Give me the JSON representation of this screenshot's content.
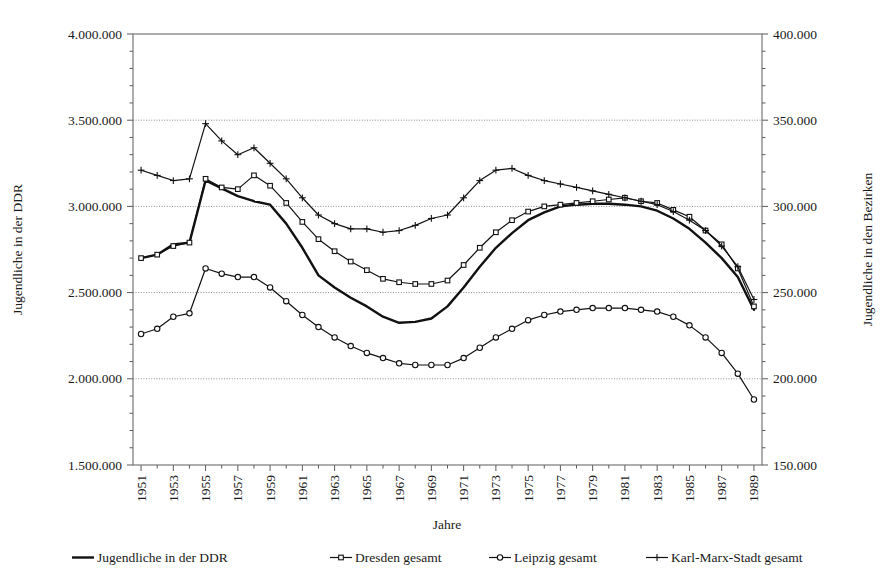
{
  "chart_data": {
    "type": "line",
    "title": "",
    "xlabel": "Jahre",
    "ylabel": "Jugendliche in der DDR",
    "ylabel_right": "Jugendliche in den Bezirken",
    "grid": true,
    "legend_position": "bottom",
    "x": [
      1951,
      1952,
      1953,
      1954,
      1955,
      1956,
      1957,
      1958,
      1959,
      1960,
      1961,
      1962,
      1963,
      1964,
      1965,
      1966,
      1967,
      1968,
      1969,
      1970,
      1971,
      1972,
      1973,
      1974,
      1975,
      1976,
      1977,
      1978,
      1979,
      1980,
      1981,
      1982,
      1983,
      1984,
      1985,
      1986,
      1987,
      1988,
      1989
    ],
    "xtick_labels": [
      "1951",
      "1953",
      "1955",
      "1957",
      "1959",
      "1961",
      "1963",
      "1965",
      "1967",
      "1969",
      "1971",
      "1973",
      "1975",
      "1977",
      "1979",
      "1981",
      "1983",
      "1985",
      "1987",
      "1989"
    ],
    "xlim": [
      1950.5,
      1989.5
    ],
    "ylim_left": [
      1500000,
      4000000
    ],
    "ytick_labels_left": [
      "1.500.000",
      "2.000.000",
      "2.500.000",
      "3.000.000",
      "3.500.000",
      "4.000.000"
    ],
    "ytick_values_left": [
      1500000,
      2000000,
      2500000,
      3000000,
      3500000,
      4000000
    ],
    "ylim_right": [
      150000,
      400000
    ],
    "ytick_labels_right": [
      "150.000",
      "200.000",
      "250.000",
      "300.000",
      "350.000",
      "400.000"
    ],
    "ytick_values_right": [
      150000,
      200000,
      250000,
      300000,
      350000,
      400000
    ],
    "series": [
      {
        "name": "Jugendliche in der DDR",
        "axis": "left",
        "marker": "none",
        "line_width": 2.4,
        "color": "#111111",
        "values": [
          2700000,
          2720000,
          2780000,
          2790000,
          3150000,
          3105000,
          3060000,
          3030000,
          3010000,
          2900000,
          2760000,
          2600000,
          2530000,
          2470000,
          2420000,
          2360000,
          2325000,
          2330000,
          2350000,
          2420000,
          2530000,
          2650000,
          2760000,
          2845000,
          2920000,
          2965000,
          3000000,
          3010000,
          3015000,
          3015000,
          3010000,
          3000000,
          2975000,
          2930000,
          2870000,
          2790000,
          2700000,
          2590000,
          2400000
        ]
      },
      {
        "name": "Dresden gesamt",
        "axis": "right",
        "marker": "square",
        "line_width": 1.2,
        "color": "#111111",
        "values": [
          270000,
          272000,
          277000,
          279000,
          316000,
          311000,
          310000,
          318000,
          312000,
          302000,
          291000,
          281000,
          274000,
          268000,
          263000,
          258000,
          256000,
          255000,
          255000,
          257000,
          266000,
          276000,
          285000,
          292000,
          297000,
          300000,
          301000,
          302000,
          303000,
          304000,
          305000,
          303000,
          302000,
          298000,
          294000,
          286000,
          278000,
          264000,
          242000
        ]
      },
      {
        "name": "Leipzig gesamt",
        "axis": "right",
        "marker": "circle",
        "line_width": 1.2,
        "color": "#111111",
        "values": [
          226000,
          229000,
          236000,
          238000,
          264000,
          261000,
          259000,
          259000,
          253000,
          245000,
          237000,
          230000,
          224000,
          219000,
          215000,
          212000,
          209000,
          208000,
          208000,
          208000,
          212000,
          218000,
          224000,
          229000,
          234000,
          237000,
          239000,
          240000,
          241000,
          241000,
          241000,
          240000,
          239000,
          236000,
          231000,
          224000,
          215000,
          203000,
          188000
        ]
      },
      {
        "name": "Karl-Marx-Stadt gesamt",
        "axis": "right",
        "marker": "plus",
        "line_width": 1.2,
        "color": "#111111",
        "values": [
          321000,
          318000,
          315000,
          316000,
          348000,
          338000,
          330000,
          334000,
          325000,
          316000,
          305000,
          295000,
          290000,
          287000,
          287000,
          285000,
          286000,
          289000,
          293000,
          295000,
          305000,
          315000,
          321000,
          322000,
          318000,
          315000,
          313000,
          311000,
          309000,
          307000,
          305000,
          303000,
          301000,
          297000,
          292000,
          286000,
          277000,
          265000,
          246000
        ]
      }
    ]
  },
  "legend": {
    "items": [
      {
        "label": "Jugendliche in der DDR",
        "marker": "none"
      },
      {
        "label": "Dresden gesamt",
        "marker": "square"
      },
      {
        "label": "Leipzig gesamt",
        "marker": "circle"
      },
      {
        "label": "Karl-Marx-Stadt gesamt",
        "marker": "plus"
      }
    ]
  }
}
